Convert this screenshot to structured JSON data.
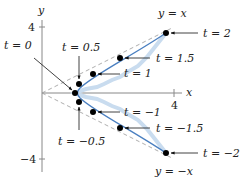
{
  "figure": {
    "type": "parametric-curve",
    "colors": {
      "curve": "#4a7fc0",
      "curve_glow": "#c9dcef",
      "axis": "#888888",
      "asymptote": "#999999",
      "point": "#000000",
      "text": "#222222"
    },
    "axes": {
      "x_label": "x",
      "y_label": "y",
      "x_ticks": [
        {
          "value": 4,
          "label": "4"
        }
      ],
      "y_ticks": [
        {
          "value": 4,
          "label": "4"
        },
        {
          "value": -4,
          "label": "−4"
        }
      ]
    },
    "asymptotes": [
      {
        "label": "y = x",
        "slope": 1
      },
      {
        "label": "y = −x",
        "slope": -1
      }
    ],
    "points": [
      {
        "t": "t = 0",
        "x": 1.0,
        "y": 0.0
      },
      {
        "t": "t = 0.5",
        "x": 1.13,
        "y": 0.52
      },
      {
        "t": "t = 1",
        "x": 1.54,
        "y": 1.18
      },
      {
        "t": "t = 1.5",
        "x": 2.35,
        "y": 2.13
      },
      {
        "t": "t = 2",
        "x": 3.76,
        "y": 3.63
      },
      {
        "t": "t = −0.5",
        "x": 1.13,
        "y": -0.52
      },
      {
        "t": "t = −1",
        "x": 1.54,
        "y": -1.18
      },
      {
        "t": "t = −1.5",
        "x": 2.35,
        "y": -2.13
      },
      {
        "t": "t = −2",
        "x": 3.76,
        "y": -3.63
      }
    ],
    "labels": {
      "t0": "t = 0",
      "t05": "t = 0.5",
      "t1": "t = 1",
      "t15": "t = 1.5",
      "t2": "t = 2",
      "tm05": "t = −0.5",
      "tm1": "t = −1",
      "tm15": "t = −1.5",
      "tm2": "t = −2",
      "asym_pos": "y = x",
      "asym_neg": "y = −x",
      "x_axis": "x",
      "y_axis": "y",
      "x_tick_4": "4",
      "y_tick_4": "4",
      "y_tick_m4": "−4"
    }
  }
}
